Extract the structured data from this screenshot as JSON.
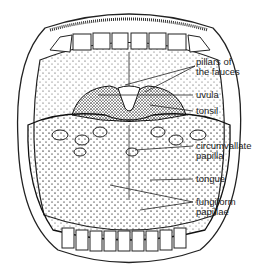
{
  "diagram": {
    "labels": [
      {
        "id": "pillars",
        "line1": "pillars of",
        "line2": "the fauces"
      },
      {
        "id": "uvula",
        "line1": "uvula"
      },
      {
        "id": "tonsil",
        "line1": "tonsil"
      },
      {
        "id": "circumvallate",
        "line1": "circumvallate",
        "line2": "papilla"
      },
      {
        "id": "tongue",
        "line1": "tongue"
      },
      {
        "id": "fungiform",
        "line1": "fungiform",
        "line2": "papillae"
      }
    ]
  }
}
